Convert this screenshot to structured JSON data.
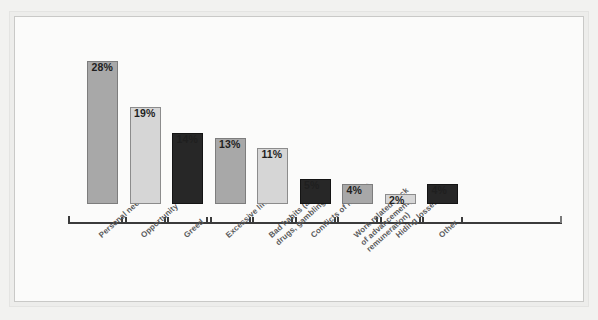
{
  "page": {
    "cropped_caption": ""
  },
  "chart_data": {
    "type": "bar",
    "title": "",
    "subtitle": "",
    "xlabel": "",
    "ylabel": "",
    "ylim": [
      0,
      30
    ],
    "grid": false,
    "legend": "none",
    "value_suffix": "%",
    "categories": [
      "Personal need",
      "Opportunity",
      "Greed",
      "Excessive lifestyle",
      "Bad habits (alcohol,\ndrugs, gambling)",
      "Conflicts of interest",
      "Work related (lack\nof advancement,\nremuneration)",
      "Hiding losses",
      "Other"
    ],
    "values": [
      28,
      19,
      14,
      13,
      11,
      5,
      4,
      2,
      4
    ],
    "value_labels": [
      "28%",
      "19%",
      "14%",
      "13%",
      "11%",
      "5%",
      "4%",
      "2%",
      "4%"
    ],
    "bar_tones": [
      "mid",
      "light",
      "dark",
      "mid",
      "light",
      "dark",
      "mid",
      "light",
      "dark"
    ],
    "colors": {
      "mid": "#a8a8a8",
      "light": "#d6d6d6",
      "dark": "#272727",
      "axis": "#3b3b3b",
      "value_text": "#1f1f1f",
      "category_text": "#5a5a5a",
      "plot_background": "#fbfbfa",
      "frame": "#c9c9c7",
      "page_background": "#f2f2f0"
    }
  }
}
